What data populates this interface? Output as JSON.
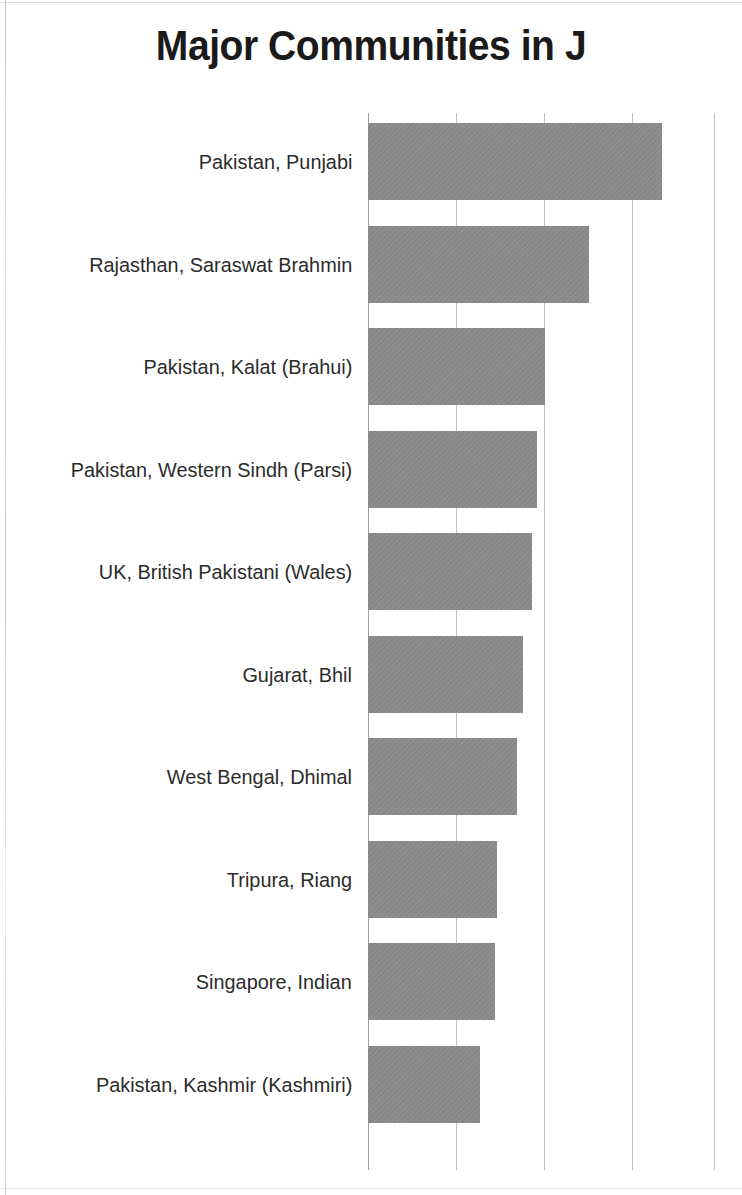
{
  "document": {
    "title": "Major Communities in J",
    "title_truncated": true
  },
  "chart_data": {
    "type": "bar",
    "orientation": "horizontal",
    "title": "Major Communities in J",
    "xlabel": "",
    "ylabel": "",
    "categories": [
      "Pakistan, Punjabi",
      "Rajasthan, Saraswat Brahmin",
      "Pakistan, Kalat (Brahui)",
      "Pakistan, Western Sindh (Parsi)",
      "UK, British Pakistani (Wales)",
      "Gujarat, Bhil",
      "West Bengal, Dhimal",
      "Tripura, Riang",
      "Singapore, Indian",
      "Pakistan, Kashmir (Kashmiri)"
    ],
    "values": [
      3.34,
      2.51,
      2.01,
      1.92,
      1.86,
      1.76,
      1.69,
      1.47,
      1.44,
      1.27
    ],
    "xlim": [
      0,
      3.93
    ],
    "gridlines": [
      0,
      1,
      2,
      3,
      3.93
    ],
    "tick_labels": [],
    "grid": true,
    "legend": false,
    "bar_color": "#8d8d8d",
    "title_color": "#1a1a1a",
    "label_color": "#2b2b2b",
    "background_color": "#ffffff"
  }
}
